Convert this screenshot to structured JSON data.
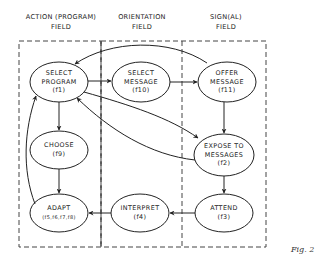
{
  "headers": {
    "action": {
      "line1": "ACTION (PROGRAM)",
      "line2": "FIELD"
    },
    "orientation": {
      "line1": "ORIENTATION",
      "line2": "FIELD"
    },
    "signal": {
      "line1": "SIGN(AL)",
      "line2": "FIELD"
    }
  },
  "nodes": {
    "select_program": {
      "line1": "SELECT",
      "line2": "PROGRAM",
      "fn": "(f1)"
    },
    "select_message": {
      "line1": "SELECT",
      "line2": "MESSAGE",
      "fn": "(f10)"
    },
    "offer_message": {
      "line1": "OFFER",
      "line2": "MESSAGE",
      "fn": "(f11)"
    },
    "choose": {
      "line1": "CHOOSE",
      "fn": "(f9)"
    },
    "expose_to_messages": {
      "line1": "EXPOSE TO",
      "line2": "MESSAGES",
      "fn": "(f2)"
    },
    "adapt": {
      "line1": "ADAPT",
      "fn": "(f5,f6,f7,f8)"
    },
    "interpret": {
      "line1": "INTERPRET",
      "fn": "(f4)"
    },
    "attend": {
      "line1": "ATTEND",
      "fn": "(f3)"
    }
  },
  "edges": [
    {
      "from": "offer_message",
      "to": "select_program"
    },
    {
      "from": "select_program",
      "to": "select_message"
    },
    {
      "from": "select_message",
      "to": "offer_message"
    },
    {
      "from": "select_program",
      "to": "choose"
    },
    {
      "from": "select_program",
      "to": "expose_to_messages"
    },
    {
      "from": "expose_to_messages",
      "to": "select_program"
    },
    {
      "from": "offer_message",
      "to": "expose_to_messages"
    },
    {
      "from": "choose",
      "to": "adapt"
    },
    {
      "from": "adapt",
      "to": "select_program"
    },
    {
      "from": "expose_to_messages",
      "to": "attend"
    },
    {
      "from": "attend",
      "to": "interpret"
    },
    {
      "from": "interpret",
      "to": "adapt"
    }
  ],
  "caption": "Fig. 2"
}
